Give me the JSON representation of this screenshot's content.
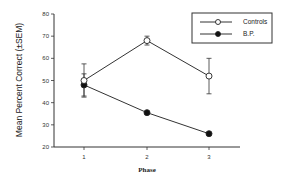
{
  "chart_data": {
    "type": "line",
    "title": "",
    "xlabel": "Phase",
    "ylabel": "Mean Percent Correct (±SEM)",
    "x": [
      1,
      2,
      3
    ],
    "categories": [
      "1",
      "2",
      "3"
    ],
    "ylim": [
      20,
      80
    ],
    "yticks": [
      20,
      30,
      40,
      50,
      60,
      70,
      80
    ],
    "grid": false,
    "legend_position": "upper right",
    "series": [
      {
        "name": "Controls",
        "marker": "open-circle",
        "values": [
          50,
          68,
          52
        ],
        "sem": [
          7.5,
          2,
          8
        ]
      },
      {
        "name": "B.P.",
        "marker": "filled-circle",
        "values": [
          48,
          35.5,
          26
        ],
        "sem": [
          5,
          0,
          0
        ]
      }
    ]
  }
}
